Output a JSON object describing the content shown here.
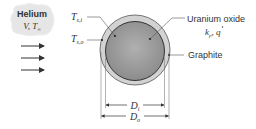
{
  "diagram": {
    "fluid": {
      "name": "Helium",
      "params": {
        "V": "V",
        "sep": ", ",
        "T": "T",
        "T_sub": "∞"
      }
    },
    "labels": {
      "inner_surface_temp": {
        "main": "T",
        "sub": "s,i"
      },
      "outer_surface_temp": {
        "main": "T",
        "sub": "s,o"
      },
      "core_material": "Uranium oxide",
      "core_props": {
        "k": "k",
        "k_sub": "p",
        "sep": ", ",
        "q": "q"
      },
      "shell_material": "Graphite",
      "inner_diameter": {
        "main": "D",
        "sub": "i"
      },
      "outer_diameter": {
        "main": "D",
        "sub": "o"
      }
    },
    "colors": {
      "cloud_fill": "#e6e6e6",
      "core_fill": "#9a9a9a",
      "shell_fill": "#cfcfcf",
      "line": "#444444"
    },
    "flow_arrows": 3
  }
}
